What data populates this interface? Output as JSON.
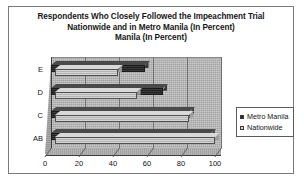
{
  "chart_data": {
    "type": "bar",
    "orientation": "horizontal",
    "title": "Respondents Who Closely Followed the Impeachment Trial Nationwide and in Metro Manila (In Percent) Manila (In Percent)",
    "title_lines": [
      "Respondents Who Closely Followed the Impeachment Trial",
      "Nationwide and in Metro Manila (In Percent)",
      "Manila (In Percent)"
    ],
    "categories": [
      "AB",
      "C",
      "D",
      "E"
    ],
    "series": [
      {
        "name": "Metro Manila",
        "values": [
          94,
          82,
          66,
          55
        ],
        "color": "#2b2b2b"
      },
      {
        "name": "Nationwide",
        "values": [
          94,
          79,
          48,
          37
        ],
        "color": "#c2c2c2"
      }
    ],
    "xlabel": "",
    "ylabel": "",
    "xlim": [
      0,
      100
    ],
    "xticks": [
      0,
      20,
      40,
      60,
      80,
      100
    ],
    "xtick_labels": [
      "0",
      "20",
      "40",
      "60",
      "80",
      "100"
    ],
    "grid": true,
    "legend_position": "right",
    "legend_entries": [
      "Metro Manila",
      "Nationwide"
    ],
    "style": "3d-bar-clustered",
    "plot_background": "#b4b4b4",
    "frame_border": "#7a7a7a"
  }
}
